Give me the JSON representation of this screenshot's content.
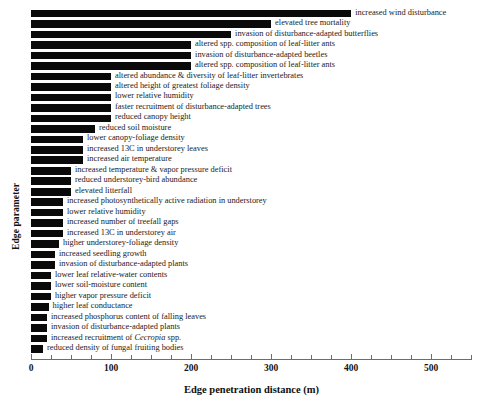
{
  "chart_data": {
    "type": "bar",
    "orientation": "horizontal",
    "title": "",
    "xlabel": "Edge penetration distance (m)",
    "ylabel": "Edge parameter",
    "xlim": [
      0,
      551
    ],
    "xticks": [
      0,
      100,
      200,
      300,
      400,
      500
    ],
    "xtick_labels": [
      "0",
      "100",
      "200",
      "300",
      "400",
      "500"
    ],
    "minor_tick_interval": 25,
    "grid": false,
    "legend": null,
    "bar_color": "#0a0a0a",
    "categories": [
      "increased wind disturbance",
      "elevated tree mortality",
      "invasion of disturbance-adapted butterflies",
      "altered spp. composition of leaf-litter ants",
      "invasion of disturbance-adapted beetles",
      "altered spp. composition of leaf-litter ants",
      "altered abundance & diversity of leaf-litter invertebrates",
      "altered height of greatest foliage density",
      "lower relative humidity",
      "faster recruitment of disturbance-adapted trees",
      "reduced canopy height",
      "reduced soil moisture",
      "lower canopy-foliage density",
      "increased 13C in understorey leaves",
      "increased air temperature",
      "increased temperature & vapor pressure deficit",
      "reduced understorey-bird abundance",
      "elevated litterfall",
      "increased photosynthetically active radiation in understorey",
      "lower relative humidity",
      "increased number of treefall gaps",
      "increased 13C in understorey air",
      "higher understorey-foliage density",
      "increased seedling growth",
      "invasion of disturbance-adapted plants",
      "lower leaf relative-water contents",
      "lower soil-moisture content",
      "higher vapor pressure deficit",
      "higher leaf conductance",
      "increased phosphorus content of falling leaves",
      "invasion of disturbance-adapted plants",
      "increased recruitment of Cecropia spp.",
      "reduced density of fungal fruiting bodies"
    ],
    "values": [
      400,
      300,
      250,
      200,
      200,
      200,
      100,
      100,
      100,
      100,
      100,
      80,
      65,
      65,
      65,
      50,
      50,
      50,
      40,
      40,
      40,
      40,
      35,
      30,
      30,
      25,
      25,
      25,
      22,
      20,
      20,
      20,
      15
    ],
    "bars": [
      {
        "label": "increased wind disturbance",
        "value": 400,
        "italic_word": null
      },
      {
        "label": "elevated tree mortality",
        "value": 300,
        "italic_word": null
      },
      {
        "label": "invasion of disturbance-adapted butterflies",
        "value": 250,
        "italic_word": null
      },
      {
        "label": "altered spp. composition of leaf-litter ants",
        "value": 200,
        "italic_word": null
      },
      {
        "label": "invasion of disturbance-adapted beetles",
        "value": 200,
        "italic_word": null
      },
      {
        "label": "altered spp. composition of leaf-litter ants",
        "value": 200,
        "italic_word": null
      },
      {
        "label": "altered abundance & diversity of leaf-litter invertebrates",
        "value": 100,
        "italic_word": null
      },
      {
        "label": "altered height of greatest foliage density",
        "value": 100,
        "italic_word": null
      },
      {
        "label": "lower relative humidity",
        "value": 100,
        "italic_word": null
      },
      {
        "label": "faster recruitment of disturbance-adapted trees",
        "value": 100,
        "italic_word": null
      },
      {
        "label": "reduced canopy height",
        "value": 100,
        "italic_word": null
      },
      {
        "label": "reduced soil moisture",
        "value": 80,
        "italic_word": null
      },
      {
        "label": "lower canopy-foliage density",
        "value": 65,
        "italic_word": null
      },
      {
        "label": "increased 13C in understorey leaves",
        "value": 65,
        "italic_word": null
      },
      {
        "label": "increased air temperature",
        "value": 65,
        "italic_word": null
      },
      {
        "label": "increased temperature & vapor pressure deficit",
        "value": 50,
        "italic_word": null
      },
      {
        "label": "reduced understorey-bird abundance",
        "value": 50,
        "italic_word": null
      },
      {
        "label": "elevated litterfall",
        "value": 50,
        "italic_word": null
      },
      {
        "label": "increased photosynthetically active radiation in understorey",
        "value": 40,
        "italic_word": null
      },
      {
        "label": "lower relative humidity",
        "value": 40,
        "italic_word": null
      },
      {
        "label": "increased number of treefall gaps",
        "value": 40,
        "italic_word": null
      },
      {
        "label": "increased 13C in understorey air",
        "value": 40,
        "italic_word": null
      },
      {
        "label": "higher understorey-foliage density",
        "value": 35,
        "italic_word": null
      },
      {
        "label": "increased seedling growth",
        "value": 30,
        "italic_word": null
      },
      {
        "label": "invasion of disturbance-adapted plants",
        "value": 30,
        "italic_word": null
      },
      {
        "label": "lower leaf relative-water contents",
        "value": 25,
        "italic_word": null
      },
      {
        "label": "lower soil-moisture content",
        "value": 25,
        "italic_word": null
      },
      {
        "label": "higher vapor pressure deficit",
        "value": 25,
        "italic_word": null
      },
      {
        "label": "higher leaf conductance",
        "value": 22,
        "italic_word": null
      },
      {
        "label": "increased phosphorus content of falling leaves",
        "value": 20,
        "italic_word": null
      },
      {
        "label": "invasion of disturbance-adapted plants",
        "value": 20,
        "italic_word": null
      },
      {
        "label": "increased recruitment of Cecropia spp.",
        "value": 20,
        "italic_word": "Cecropia"
      },
      {
        "label": "reduced density of fungal fruiting bodies",
        "value": 15,
        "italic_word": null
      }
    ]
  }
}
